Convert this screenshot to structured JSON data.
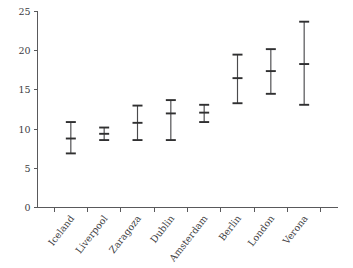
{
  "chart_data": {
    "type": "scatter",
    "title": "",
    "subtitle": "",
    "xlabel": "",
    "ylabel": "",
    "ylim": [
      0,
      25
    ],
    "yticks": [
      0,
      5,
      10,
      15,
      20,
      25
    ],
    "ytick_labels": [
      "0",
      "5",
      "10",
      "15",
      "20",
      "25"
    ],
    "grid": false,
    "legend": "none",
    "categories": [
      "Iceland",
      "Liverpool",
      "Zaragoza",
      "Dublin",
      "Amsterdam",
      "Berlin",
      "London",
      "Verona"
    ],
    "series": [
      {
        "name": "estimate",
        "values": [
          8.8,
          9.4,
          10.8,
          12.0,
          12.1,
          16.5,
          17.4,
          18.3
        ]
      },
      {
        "name": "lower",
        "values": [
          6.9,
          8.6,
          8.6,
          8.6,
          10.9,
          13.3,
          14.5,
          13.1
        ]
      },
      {
        "name": "upper",
        "values": [
          10.9,
          10.2,
          13.0,
          13.7,
          13.1,
          19.5,
          20.2,
          23.7
        ]
      }
    ],
    "points": [
      {
        "category": "Iceland",
        "value": 8.8,
        "low": 6.9,
        "high": 10.9
      },
      {
        "category": "Liverpool",
        "value": 9.4,
        "low": 8.6,
        "high": 10.2
      },
      {
        "category": "Zaragoza",
        "value": 10.8,
        "low": 8.6,
        "high": 13.0
      },
      {
        "category": "Dublin",
        "value": 12.0,
        "low": 8.6,
        "high": 13.7
      },
      {
        "category": "Amsterdam",
        "value": 12.1,
        "low": 10.9,
        "high": 13.1
      },
      {
        "category": "Berlin",
        "value": 16.5,
        "low": 13.3,
        "high": 19.5
      },
      {
        "category": "London",
        "value": 17.4,
        "low": 14.5,
        "high": 20.2
      },
      {
        "category": "Verona",
        "value": 18.3,
        "low": 13.1,
        "high": 23.7
      }
    ],
    "marker_style": "error-bar-with-midline",
    "colors": {
      "axis": "#59595b",
      "marker": "#303031",
      "stem": "#4a4a4c",
      "background": "#ffffff",
      "text": "#3d3d3f"
    }
  }
}
